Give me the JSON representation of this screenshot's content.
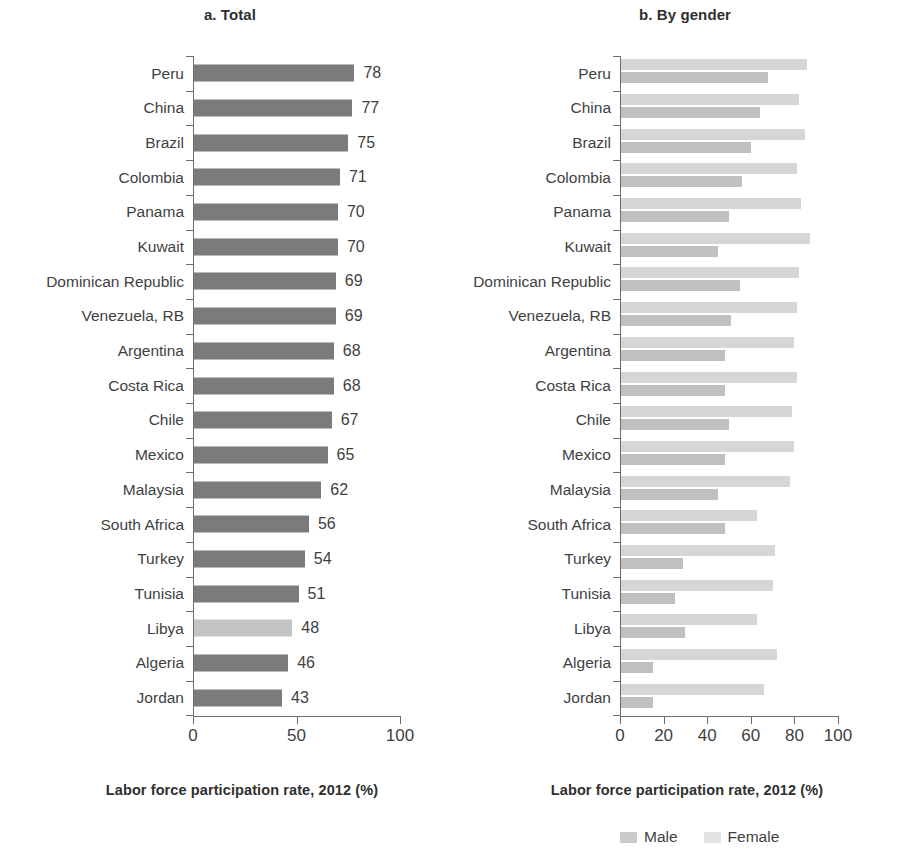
{
  "chart_data": [
    {
      "type": "bar",
      "title": "a. Total",
      "xlabel": "Labor force participation rate, 2012 (%)",
      "ylabel": "",
      "xlim": [
        0,
        100
      ],
      "xticks": [
        0,
        50,
        100
      ],
      "grid": false,
      "orientation": "horizontal",
      "categories": [
        "Peru",
        "China",
        "Brazil",
        "Colombia",
        "Panama",
        "Kuwait",
        "Dominican Republic",
        "Venezuela, RB",
        "Argentina",
        "Costa Rica",
        "Chile",
        "Mexico",
        "Malaysia",
        "South Africa",
        "Turkey",
        "Tunisia",
        "Libya",
        "Algeria",
        "Jordan"
      ],
      "values": [
        78,
        77,
        75,
        71,
        70,
        70,
        69,
        69,
        68,
        68,
        67,
        65,
        62,
        56,
        54,
        51,
        48,
        46,
        43
      ],
      "data_labels": [
        "78",
        "77",
        "75",
        "71",
        "70",
        "70",
        "69",
        "69",
        "68",
        "68",
        "67",
        "65",
        "62",
        "56",
        "54",
        "51",
        "48",
        "46",
        "43"
      ],
      "highlight_category": "Libya",
      "bar_color": "#7b7b7b",
      "highlight_color": "#c4c4c4"
    },
    {
      "type": "bar",
      "title": "b. By gender",
      "xlabel": "Labor force participation rate, 2012 (%)",
      "ylabel": "",
      "xlim": [
        0,
        100
      ],
      "xticks": [
        0,
        20,
        40,
        60,
        80,
        100
      ],
      "grid": false,
      "orientation": "horizontal",
      "legend_position": "bottom-right",
      "categories": [
        "Peru",
        "China",
        "Brazil",
        "Colombia",
        "Panama",
        "Kuwait",
        "Dominican Republic",
        "Venezuela, RB",
        "Argentina",
        "Costa Rica",
        "Chile",
        "Mexico",
        "Malaysia",
        "South Africa",
        "Turkey",
        "Tunisia",
        "Libya",
        "Algeria",
        "Jordan"
      ],
      "series": [
        {
          "name": "Male",
          "color": "#d6d6d6",
          "values": [
            86,
            82,
            85,
            81,
            83,
            87,
            82,
            81,
            80,
            81,
            79,
            80,
            78,
            63,
            71,
            70,
            63,
            72,
            66
          ]
        },
        {
          "name": "Female",
          "color": "#c0c0c0",
          "values": [
            68,
            64,
            60,
            56,
            50,
            45,
            55,
            51,
            48,
            48,
            50,
            48,
            45,
            48,
            29,
            25,
            30,
            15,
            15
          ]
        }
      ]
    }
  ],
  "panels": {
    "left": {
      "title": "a. Total",
      "caption": "Labor force participation rate, 2012 (%)",
      "xticklabels": [
        "0",
        "50",
        "100"
      ]
    },
    "right": {
      "title": "b. By gender",
      "caption": "Labor force participation rate, 2012 (%)",
      "xticklabels": [
        "0",
        "20",
        "40",
        "60",
        "80",
        "100"
      ]
    }
  },
  "legend": {
    "male_label": "Male",
    "female_label": "Female"
  }
}
